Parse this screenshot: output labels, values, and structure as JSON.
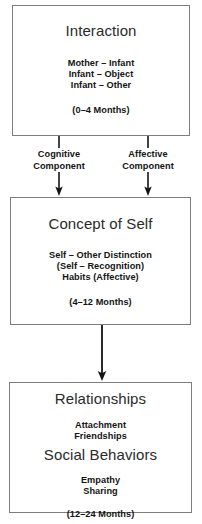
{
  "diagram": {
    "stroke_color": "#7d7d7d",
    "text_color": "#141414",
    "background": "#ffffff",
    "nodes": [
      {
        "id": "interaction",
        "heading": "Interaction",
        "items": [
          "Mother – Infant",
          "Infant – Object",
          "Infant – Other"
        ],
        "age": "(0–4 Months)"
      },
      {
        "id": "concept-of-self",
        "heading": "Concept of Self",
        "items": [
          "Self – Other Distinction",
          "(Self – Recognition)",
          "Habits (Affective)"
        ],
        "age": "(4–12 Months)"
      },
      {
        "id": "relationships-social-behaviors",
        "heading_one": "Relationships",
        "items_one": [
          "Attachment",
          "Friendships"
        ],
        "heading_two": "Social Behaviors",
        "items_two": [
          "Empathy",
          "Sharing"
        ],
        "age": "(12–24 Months)"
      }
    ],
    "edges": [
      {
        "id": "cognitive",
        "label_line_1": "Cognitive",
        "label_line_2": "Component",
        "from": "interaction",
        "to": "concept-of-self"
      },
      {
        "id": "affective",
        "label_line_1": "Affective",
        "label_line_2": "Component",
        "from": "interaction",
        "to": "concept-of-self"
      },
      {
        "id": "self-to-relationships",
        "label_line_1": "",
        "label_line_2": "",
        "from": "concept-of-self",
        "to": "relationships-social-behaviors"
      }
    ]
  }
}
